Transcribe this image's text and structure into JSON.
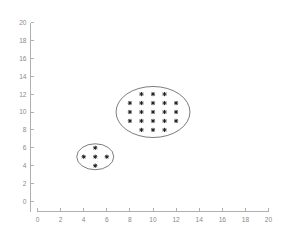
{
  "chart_data": {
    "type": "scatter",
    "title": "",
    "xlabel": "",
    "ylabel": "",
    "xlim": [
      0,
      20
    ],
    "ylim": [
      0,
      20
    ],
    "xticks": [
      0,
      2,
      4,
      6,
      8,
      10,
      12,
      14,
      16,
      18,
      20
    ],
    "yticks": [
      0,
      2,
      4,
      6,
      8,
      10,
      12,
      14,
      16,
      18,
      20
    ],
    "grid": false,
    "legend": null,
    "marker_style": "plus",
    "marker_color": "#1a1a1a",
    "axis_color": "#b0b0b0",
    "tick_label_color": "#8a8a8a",
    "cluster_outline_color": "#5a5a5a",
    "series": [
      {
        "name": "small-cluster",
        "point_count": 5,
        "points": [
          {
            "x": 5,
            "y": 6
          },
          {
            "x": 4,
            "y": 5
          },
          {
            "x": 5,
            "y": 5
          },
          {
            "x": 6,
            "y": 5
          },
          {
            "x": 5,
            "y": 4
          }
        ],
        "boundary": {
          "shape": "ellipse",
          "cx": 5,
          "cy": 5,
          "rx": 1.6,
          "ry": 1.45
        }
      },
      {
        "name": "large-cluster",
        "point_count": 21,
        "points": [
          {
            "x": 9,
            "y": 12
          },
          {
            "x": 10,
            "y": 12
          },
          {
            "x": 11,
            "y": 12
          },
          {
            "x": 8,
            "y": 11
          },
          {
            "x": 9,
            "y": 11
          },
          {
            "x": 10,
            "y": 11
          },
          {
            "x": 11,
            "y": 11
          },
          {
            "x": 12,
            "y": 11
          },
          {
            "x": 8,
            "y": 10
          },
          {
            "x": 9,
            "y": 10
          },
          {
            "x": 10,
            "y": 10
          },
          {
            "x": 11,
            "y": 10
          },
          {
            "x": 12,
            "y": 10
          },
          {
            "x": 8,
            "y": 9
          },
          {
            "x": 9,
            "y": 9
          },
          {
            "x": 10,
            "y": 9
          },
          {
            "x": 11,
            "y": 9
          },
          {
            "x": 12,
            "y": 9
          },
          {
            "x": 9,
            "y": 8
          },
          {
            "x": 10,
            "y": 8
          },
          {
            "x": 11,
            "y": 8
          }
        ],
        "boundary": {
          "shape": "ellipse",
          "cx": 10,
          "cy": 10,
          "rx": 3.2,
          "ry": 2.85
        }
      }
    ]
  }
}
